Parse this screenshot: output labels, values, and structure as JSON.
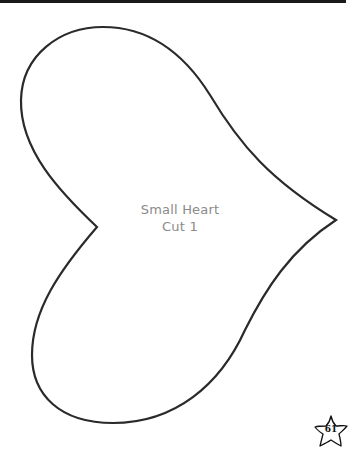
{
  "page": {
    "shape_name": "Small Heart",
    "cut_instruction": "Cut 1",
    "page_number": "61"
  },
  "colors": {
    "outline": "#2a2a2a",
    "label_text": "#8a8a8a",
    "top_bar": "#1a1a1a"
  }
}
